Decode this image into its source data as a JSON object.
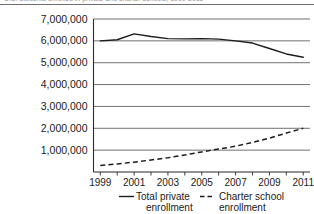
{
  "caption": {
    "text": "U.S. students enrolled in private and charter schools, 1999-2011"
  },
  "chart_data": {
    "type": "line",
    "title": "",
    "subtitle": "",
    "xlabel": "",
    "ylabel": "",
    "x": [
      1999,
      2000,
      2001,
      2002,
      2003,
      2004,
      2005,
      2006,
      2007,
      2008,
      2009,
      2010,
      2011
    ],
    "xlim": [
      1998.6,
      2011.4
    ],
    "ylim": [
      0,
      7000000
    ],
    "grid": true,
    "legend_position": "bottom",
    "xtick_labels": [
      "1999",
      "2001",
      "2003",
      "2005",
      "2007",
      "2009",
      "2011"
    ],
    "xtick_values": [
      1999,
      2001,
      2003,
      2005,
      2007,
      2009,
      2011
    ],
    "ytick_labels": [
      "1,000,000",
      "2,000,000",
      "3,000,000",
      "4,000,000",
      "5,000,000",
      "6,000,000",
      "7,000,000"
    ],
    "ytick_values": [
      1000000,
      2000000,
      3000000,
      4000000,
      5000000,
      6000000,
      7000000
    ],
    "series": [
      {
        "name": "Total private enrollment",
        "style": "solid",
        "color": "#1c1c1c",
        "values": [
          6000000,
          6050000,
          6320000,
          6200000,
          6100000,
          6090000,
          6100000,
          6080000,
          6000000,
          5900000,
          5650000,
          5400000,
          5250000
        ]
      },
      {
        "name": "Charter school enrollment",
        "style": "dashed",
        "color": "#1c1c1c",
        "values": [
          300000,
          370000,
          450000,
          550000,
          650000,
          780000,
          920000,
          1050000,
          1180000,
          1350000,
          1550000,
          1780000,
          2000000
        ]
      }
    ]
  },
  "legend": {
    "items": [
      {
        "label_line1": "Total private",
        "label_line2": "enrollment",
        "style": "solid"
      },
      {
        "label_line1": "Charter school",
        "label_line2": "enrollment",
        "style": "dashed"
      }
    ]
  }
}
